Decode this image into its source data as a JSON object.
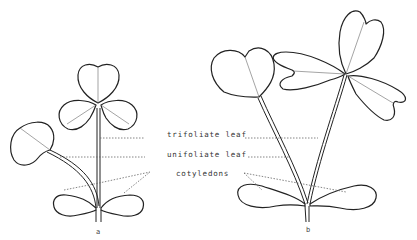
{
  "diagram": {
    "labels": {
      "trifoliate": "trifoliate leaf",
      "unifoliate": "unifoliate leaf",
      "cotyledons": "cotyledons"
    },
    "figures": [
      {
        "id": "a",
        "caption": "a"
      },
      {
        "id": "b",
        "caption": "b"
      }
    ],
    "colors": {
      "line": "#222222",
      "dashed_leader": "#666666",
      "background": "#ffffff"
    }
  }
}
